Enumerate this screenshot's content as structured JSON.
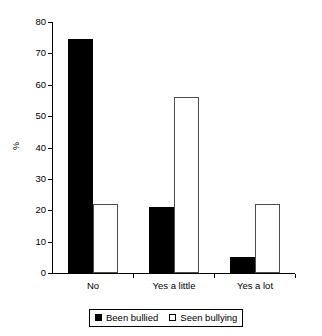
{
  "chart_data": {
    "type": "bar",
    "title": "",
    "subtitle": "",
    "xlabel": "",
    "ylabel": "%",
    "categories": [
      "No",
      "Yes a little",
      "Yes a lot"
    ],
    "series": [
      {
        "name": "Been bullied",
        "style": "filled",
        "color": "#000000",
        "values": [
          74.5,
          21,
          5
        ]
      },
      {
        "name": "Seen bullying",
        "style": "open",
        "color": "#ffffff",
        "values": [
          22,
          56,
          22
        ]
      }
    ],
    "ylim": [
      0,
      80
    ],
    "ytick_step": 10,
    "ytick_labels": [
      "0",
      "10",
      "20",
      "30",
      "40",
      "50",
      "60",
      "70",
      "80"
    ],
    "grid": false,
    "legend_position": "bottom-center",
    "legend_boxed": true,
    "axis_color": "#000000"
  },
  "legend": {
    "items": [
      {
        "label": "Been bullied",
        "swatch": "filled-square"
      },
      {
        "label": "Seen bullying",
        "swatch": "open-square"
      }
    ]
  }
}
